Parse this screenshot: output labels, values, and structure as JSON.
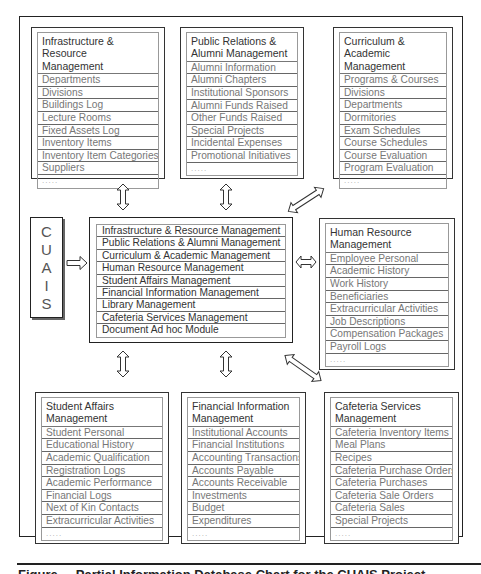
{
  "diagram": {
    "title_system": "CUAIS",
    "cuais_letters": [
      "C",
      "U",
      "A",
      "I",
      "S"
    ],
    "central_modules": [
      "Infrastructure & Resource Management",
      "Public Relations & Alumni Management",
      "Curriculum & Academic Management",
      "Human Resource Management",
      "Student Affairs Management",
      "Financial Information Management",
      "Library Management",
      "Cafeteria Services Management",
      "Document Ad hoc Module"
    ],
    "modules": {
      "infrastructure": {
        "title_line1": "Infrastructure & Resource",
        "title_line2": "Management",
        "items": [
          "Departments",
          "Divisions",
          "Buildings Log",
          "Lecture Rooms",
          "Fixed Assets Log",
          "Inventory Items",
          "Inventory Item Categories",
          "Suppliers",
          "....."
        ]
      },
      "public_relations": {
        "title_line1": "Public Relations &",
        "title_line2": "Alumni Management",
        "items": [
          "Alumni Information",
          "Alumni Chapters",
          "Institutional Sponsors",
          "Alumni Funds Raised",
          "Other Funds Raised",
          "Special Projects",
          "Incidental Expenses",
          "Promotional Initiatives",
          "....."
        ]
      },
      "curriculum": {
        "title_line1": "Curriculum & Academic",
        "title_line2": "Management",
        "items": [
          "Programs & Courses",
          "Divisions",
          "Departments",
          "Dormitories",
          "Exam Schedules",
          "Course Schedules",
          "Course Evaluation",
          "Program Evaluation",
          "....."
        ]
      },
      "human_resource": {
        "title_line1": "Human Resource",
        "title_line2": "Management",
        "items": [
          "Employee Personal",
          "Academic History",
          "Work History",
          "Beneficiaries",
          "Extracurricular Activities",
          "Job Descriptions",
          "Compensation Packages",
          "Payroll Logs",
          "....."
        ]
      },
      "student_affairs": {
        "title_line1": "Student Affairs",
        "title_line2": "Management",
        "items": [
          "Student Personal",
          "Educational History",
          "Academic Qualification",
          "Registration Logs",
          "Academic Performance",
          "Financial Logs",
          "Next of Kin Contacts",
          "Extracurricular Activities",
          "....."
        ]
      },
      "financial": {
        "title_line1": "Financial Information",
        "title_line2": "Management",
        "items": [
          "Institutional Accounts",
          "Financial Institutions",
          "Accounting Transactions",
          "Accounts Payable",
          "Accounts Receivable",
          "Investments",
          "Budget",
          "Expenditures",
          "....."
        ]
      },
      "cafeteria": {
        "title_line1": "Cafeteria Services",
        "title_line2": "Management",
        "items": [
          "Cafeteria Inventory Items",
          "Meal Plans",
          "Recipes",
          "Cafeteria Purchase Orders",
          "Cafeteria Purchases",
          "Cafeteria Sale Orders",
          "Cafeteria Sales",
          "Special Projects",
          "....."
        ]
      }
    },
    "caption": "Figure ... Partial Information Database Chart for the CUAIS Project"
  }
}
